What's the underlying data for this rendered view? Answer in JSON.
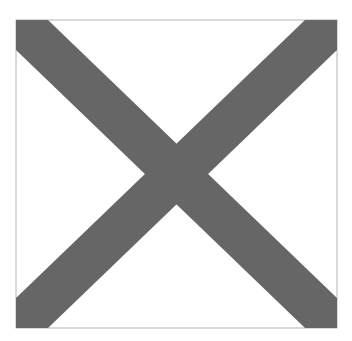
{
  "figure": {
    "frame": {
      "x": 16,
      "y": 20,
      "width": 321,
      "height": 308,
      "stroke": "#b5b5b5"
    },
    "cross": {
      "color": "#666666",
      "band_width": 32
    },
    "background": "#ffffff"
  }
}
